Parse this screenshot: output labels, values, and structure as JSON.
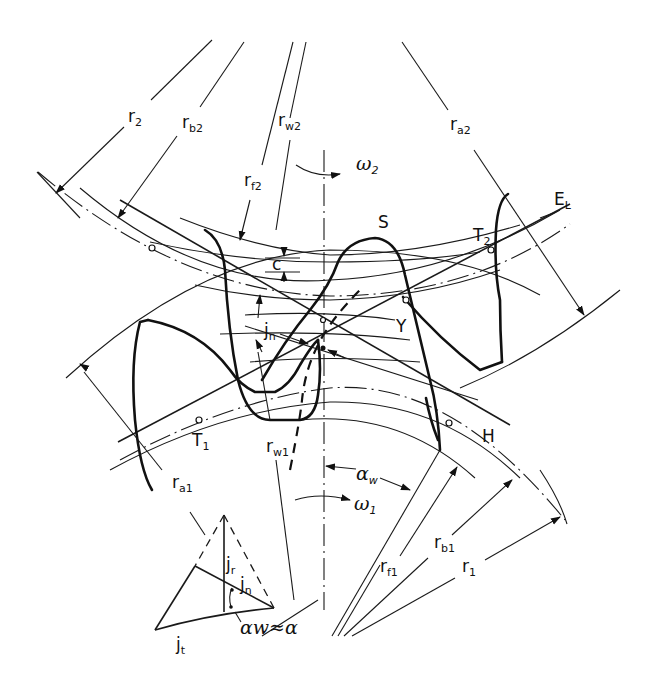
{
  "figure": {
    "type": "involute gear meshing diagram",
    "labels": {
      "r2": {
        "main": "r",
        "sub": "2"
      },
      "rb2": {
        "main": "r",
        "sub": "b2"
      },
      "rw2": {
        "main": "r",
        "sub": "w2"
      },
      "rf2": {
        "main": "r",
        "sub": "f2"
      },
      "ra2": {
        "main": "r",
        "sub": "a2"
      },
      "omega2": {
        "main": "ω",
        "sub": "2"
      },
      "EL": {
        "main": "E",
        "sub": "L"
      },
      "S": {
        "main": "S"
      },
      "T2": {
        "main": "T",
        "sub": "2"
      },
      "c": {
        "main": "c"
      },
      "jn": {
        "main": "j",
        "sub": "n"
      },
      "Y": {
        "main": "Y"
      },
      "T1": {
        "main": "T",
        "sub": "1"
      },
      "H": {
        "main": "H"
      },
      "rw1": {
        "main": "r",
        "sub": "w1"
      },
      "ra1": {
        "main": "r",
        "sub": "a1"
      },
      "alpha_w": {
        "main": "α",
        "sub": "w"
      },
      "omega1": {
        "main": "ω",
        "sub": "1"
      },
      "rf1": {
        "main": "r",
        "sub": "f1"
      },
      "rb1": {
        "main": "r",
        "sub": "b1"
      },
      "r1": {
        "main": "r",
        "sub": "1"
      }
    },
    "inset": {
      "jr": {
        "main": "j",
        "sub": "r"
      },
      "jn": {
        "main": "j",
        "sub": "n"
      },
      "jt": {
        "main": "j",
        "sub": "t"
      },
      "angle_relation": "αw≈α"
    }
  }
}
